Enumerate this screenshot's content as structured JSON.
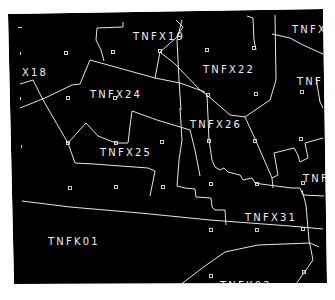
{
  "map": {
    "background_color": "#000000",
    "line_color": "#e6e6e6",
    "text_color": "#f0f0f0",
    "page_color": "#ffffff",
    "frame_corners": [
      [
        8,
        14
      ],
      [
        323,
        9
      ],
      [
        327,
        283
      ],
      [
        14,
        284
      ]
    ]
  },
  "zones": [
    {
      "label": "X18",
      "x": 22,
      "y": 76
    },
    {
      "label": "TNFX19",
      "x": 133,
      "y": 40
    },
    {
      "label": "TNFX",
      "x": 292,
      "y": 33
    },
    {
      "label": "TNFX22",
      "x": 203,
      "y": 73
    },
    {
      "label": "TNFX24",
      "x": 90,
      "y": 98
    },
    {
      "label": "TNF",
      "x": 297,
      "y": 85
    },
    {
      "label": "TNFX26",
      "x": 190,
      "y": 128
    },
    {
      "label": "TNFX25",
      "x": 100,
      "y": 156
    },
    {
      "label": "TNF",
      "x": 303,
      "y": 182
    },
    {
      "label": "TNFX31",
      "x": 245,
      "y": 221
    },
    {
      "label": "TNFK01",
      "x": 48,
      "y": 245
    },
    {
      "label": "TNFK03",
      "x": 220,
      "y": 289
    }
  ],
  "markers": [
    [
      66,
      53
    ],
    [
      113,
      52
    ],
    [
      160,
      51
    ],
    [
      207,
      50
    ],
    [
      254,
      48
    ],
    [
      68,
      98
    ],
    [
      115,
      98
    ],
    [
      208,
      95
    ],
    [
      256,
      94
    ],
    [
      302,
      92
    ],
    [
      68,
      143
    ],
    [
      116,
      143
    ],
    [
      162,
      142
    ],
    [
      209,
      141
    ],
    [
      255,
      141
    ],
    [
      301,
      139
    ],
    [
      70,
      188
    ],
    [
      116,
      187
    ],
    [
      163,
      187
    ],
    [
      211,
      184
    ],
    [
      257,
      184
    ],
    [
      303,
      183
    ],
    [
      211,
      230
    ],
    [
      257,
      230
    ],
    [
      303,
      229
    ],
    [
      211,
      276
    ],
    [
      304,
      272
    ]
  ],
  "edge_ticks": [
    [
      20,
      28
    ],
    [
      21,
      54
    ],
    [
      21,
      99
    ],
    [
      22,
      147
    ]
  ]
}
